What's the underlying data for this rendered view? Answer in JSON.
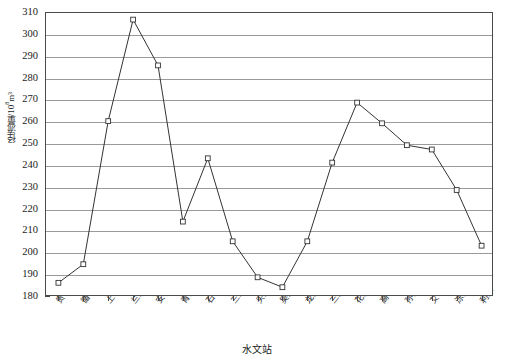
{
  "chart_data": {
    "type": "line",
    "title": "",
    "xlabel": "水文站",
    "ylabel_text": "径流量/10",
    "ylabel_sup": "8",
    "ylabel_unit": "m³",
    "categories": [
      "贵德",
      "循化",
      "上诠",
      "兰州",
      "安宁渡",
      "青铜峡",
      "石嘴山",
      "三湖河口",
      "头道拐",
      "吴堡",
      "龙门",
      "三门峡",
      "花园口",
      "高村",
      "孙口",
      "艾山",
      "泺口",
      "利津"
    ],
    "values": [
      186.5,
      195.0,
      260.5,
      307.0,
      286.0,
      214.5,
      243.5,
      205.5,
      189.0,
      184.5,
      205.5,
      241.5,
      269.0,
      259.5,
      249.5,
      247.5,
      229.0,
      203.5
    ],
    "ylim": [
      180,
      310
    ],
    "ytick_step": 10,
    "yticks": [
      310,
      300,
      290,
      280,
      270,
      260,
      250,
      240,
      230,
      220,
      210,
      200,
      190,
      180
    ],
    "grid": true,
    "legend": "none",
    "marker": "open-square",
    "series_color": "#333333",
    "grid_color": "#9a9a9a",
    "axis_color": "#4a4a4a"
  }
}
